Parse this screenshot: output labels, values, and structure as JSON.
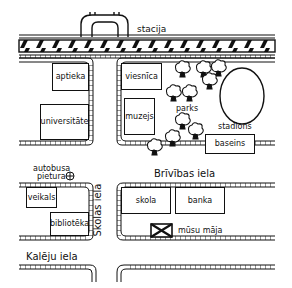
{
  "map": {
    "labels": {
      "station": "stacija",
      "park": "parks",
      "stadium": "stadions",
      "bus_stop": "autobusa\npietura",
      "bus_stop_line1": "autobusa",
      "bus_stop_line2": "pietura",
      "our_house": "mūsu māja"
    },
    "streets": {
      "brivibas": "Brīvības iela",
      "skolas": "Skolas iela",
      "kaleju": "Kalēju iela"
    },
    "buildings": [
      {
        "id": "pharmacy",
        "label": "aptieka"
      },
      {
        "id": "university",
        "label": "universitāte"
      },
      {
        "id": "hotel",
        "label": "viesnīca"
      },
      {
        "id": "museum",
        "label": "muzejs"
      },
      {
        "id": "pool",
        "label": "baseins"
      },
      {
        "id": "shop",
        "label": "veikals"
      },
      {
        "id": "library",
        "label": "bibliotēka"
      },
      {
        "id": "school",
        "label": "skola"
      },
      {
        "id": "bank",
        "label": "banka"
      }
    ]
  }
}
